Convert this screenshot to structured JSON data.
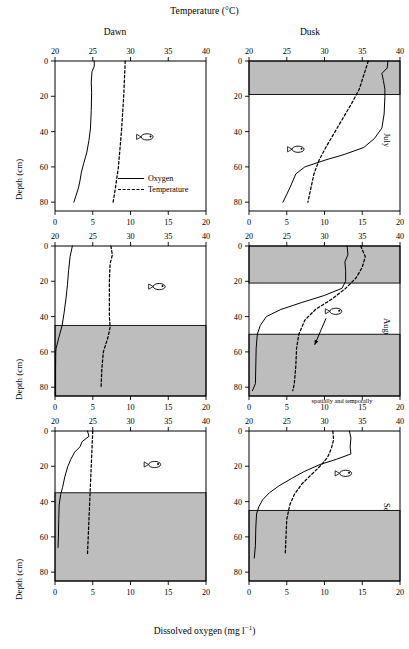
{
  "figure": {
    "top_axis_title": "Temperature (°C)",
    "bottom_axis_title": "Dissolved oxygen (mg l",
    "bottom_axis_title_sup": "−1",
    "bottom_axis_title_tail": ")",
    "depth_axis_title": "Depth (cm)",
    "column_titles": [
      "Dawn",
      "Dusk"
    ],
    "row_titles": [
      "July",
      "August",
      "September"
    ],
    "legend": {
      "oxygen_label": "Oxygen",
      "temperature_label": "Temperature"
    },
    "annotation": {
      "text": "The unshaded area available to fish compresses and expands spatially and temporally",
      "lines": [
        "The unshaded area",
        "available to fish",
        "compresses and expands",
        "spatially and temporally"
      ]
    },
    "colors": {
      "shaded_band": "#bdbdbd",
      "axis": "#000000",
      "oxygen_line": "#000000",
      "temperature_line": "#000000"
    },
    "icon_names": [
      "fish-icon",
      "annotation-arrow-icon"
    ]
  },
  "chart_data": {
    "type": "line",
    "xlabel": "Dissolved oxygen (mg l-1)",
    "ylabel": "Depth (cm)",
    "top_xlabel": "Temperature (°C)",
    "ylim": [
      0,
      85
    ],
    "y_inverted": true,
    "oxygen_xlim": [
      0,
      20
    ],
    "oxygen_ticks": [
      0,
      5,
      10,
      15,
      20
    ],
    "temperature_xlim": [
      20,
      40
    ],
    "temperature_ticks": [
      20,
      25,
      30,
      35,
      40
    ],
    "depth_ticks": [
      0,
      20,
      40,
      60,
      80
    ],
    "grid": false,
    "legend_position": "inside-lower-center-left-panel",
    "panels": [
      {
        "row": "July",
        "column": "Dawn",
        "shaded_bands": [],
        "fish_marker": {
          "oxygen": 12.2,
          "depth": 43
        },
        "series": [
          {
            "name": "Oxygen",
            "style": "solid",
            "axis": "bottom",
            "units": "mg l-1",
            "points": [
              {
                "depth": 0,
                "value": 5.2
              },
              {
                "depth": 3,
                "value": 5.2
              },
              {
                "depth": 6,
                "value": 4.9
              },
              {
                "depth": 12,
                "value": 4.8
              },
              {
                "depth": 18,
                "value": 4.85
              },
              {
                "depth": 28,
                "value": 4.8
              },
              {
                "depth": 38,
                "value": 4.7
              },
              {
                "depth": 45,
                "value": 4.5
              },
              {
                "depth": 52,
                "value": 4.2
              },
              {
                "depth": 58,
                "value": 3.8
              },
              {
                "depth": 63,
                "value": 3.5
              },
              {
                "depth": 68,
                "value": 3.3
              },
              {
                "depth": 72,
                "value": 3.1
              },
              {
                "depth": 76,
                "value": 2.8
              },
              {
                "depth": 80,
                "value": 2.5
              }
            ]
          },
          {
            "name": "Temperature",
            "style": "dashed",
            "axis": "top",
            "units": "°C",
            "points": [
              {
                "depth": 0,
                "value": 29.3
              },
              {
                "depth": 20,
                "value": 29.1
              },
              {
                "depth": 40,
                "value": 28.8
              },
              {
                "depth": 60,
                "value": 28.4
              },
              {
                "depth": 72,
                "value": 28.0
              },
              {
                "depth": 80,
                "value": 27.7
              }
            ]
          }
        ]
      },
      {
        "row": "July",
        "column": "Dusk",
        "shaded_bands": [
          {
            "top": 0,
            "bottom": 19
          }
        ],
        "fish_marker": {
          "oxygen": 6.5,
          "depth": 50
        },
        "series": [
          {
            "name": "Oxygen",
            "style": "solid",
            "axis": "bottom",
            "units": "mg l-1",
            "points": [
              {
                "depth": 0,
                "value": 18.4
              },
              {
                "depth": 4,
                "value": 18.3
              },
              {
                "depth": 7,
                "value": 17.6
              },
              {
                "depth": 11,
                "value": 17.8
              },
              {
                "depth": 16,
                "value": 18.0
              },
              {
                "depth": 20,
                "value": 18.0
              },
              {
                "depth": 30,
                "value": 17.9
              },
              {
                "depth": 38,
                "value": 17.6
              },
              {
                "depth": 44,
                "value": 16.6
              },
              {
                "depth": 49,
                "value": 15.2
              },
              {
                "depth": 53,
                "value": 12.6
              },
              {
                "depth": 56,
                "value": 10.2
              },
              {
                "depth": 60,
                "value": 7.4
              },
              {
                "depth": 64,
                "value": 6.2
              },
              {
                "depth": 72,
                "value": 5.4
              },
              {
                "depth": 80,
                "value": 4.5
              }
            ]
          },
          {
            "name": "Temperature",
            "style": "dashed",
            "axis": "top",
            "units": "°C",
            "points": [
              {
                "depth": 0,
                "value": 35.8
              },
              {
                "depth": 8,
                "value": 35.2
              },
              {
                "depth": 16,
                "value": 34.6
              },
              {
                "depth": 24,
                "value": 33.6
              },
              {
                "depth": 32,
                "value": 32.5
              },
              {
                "depth": 40,
                "value": 31.4
              },
              {
                "depth": 48,
                "value": 30.3
              },
              {
                "depth": 56,
                "value": 29.3
              },
              {
                "depth": 64,
                "value": 28.6
              },
              {
                "depth": 72,
                "value": 28.2
              },
              {
                "depth": 80,
                "value": 27.8
              }
            ]
          }
        ]
      },
      {
        "row": "August",
        "column": "Dawn",
        "shaded_bands": [
          {
            "top": 45,
            "bottom": 85
          }
        ],
        "fish_marker": {
          "oxygen": 13.8,
          "depth": 23
        },
        "series": [
          {
            "name": "Oxygen",
            "style": "solid",
            "axis": "bottom",
            "units": "mg l-1",
            "points": [
              {
                "depth": 0,
                "value": 2.3
              },
              {
                "depth": 6,
                "value": 2.0
              },
              {
                "depth": 14,
                "value": 1.8
              },
              {
                "depth": 22,
                "value": 1.65
              },
              {
                "depth": 30,
                "value": 1.45
              },
              {
                "depth": 38,
                "value": 1.2
              },
              {
                "depth": 45,
                "value": 0.95
              },
              {
                "depth": 52,
                "value": 0.5
              },
              {
                "depth": 58,
                "value": 0.15
              },
              {
                "depth": 60,
                "value": 0.1
              },
              {
                "depth": 70,
                "value": 0.08
              },
              {
                "depth": 80,
                "value": 0.08
              },
              {
                "depth": 85,
                "value": 0.08
              }
            ]
          },
          {
            "name": "Temperature",
            "style": "dashed",
            "axis": "top",
            "units": "°C",
            "points": [
              {
                "depth": 0,
                "value": 27.4
              },
              {
                "depth": 5,
                "value": 27.6
              },
              {
                "depth": 10,
                "value": 27.3
              },
              {
                "depth": 20,
                "value": 27.2
              },
              {
                "depth": 30,
                "value": 27.2
              },
              {
                "depth": 40,
                "value": 27.2
              },
              {
                "depth": 46,
                "value": 27.3
              },
              {
                "depth": 52,
                "value": 27.0
              },
              {
                "depth": 60,
                "value": 26.4
              },
              {
                "depth": 70,
                "value": 26.2
              },
              {
                "depth": 80,
                "value": 26.1
              }
            ]
          }
        ]
      },
      {
        "row": "August",
        "column": "Dusk",
        "shaded_bands": [
          {
            "top": 0,
            "bottom": 21
          },
          {
            "top": 50,
            "bottom": 85
          }
        ],
        "fish_marker": {
          "oxygen": 11.5,
          "depth": 37
        },
        "annotation_arrow": {
          "from_oxygen": 10.2,
          "from_depth": 41,
          "to_oxygen": 8.7,
          "to_depth": 56
        },
        "series": [
          {
            "name": "Oxygen",
            "style": "solid",
            "axis": "bottom",
            "units": "mg l-1",
            "points": [
              {
                "depth": 0,
                "value": 13.0
              },
              {
                "depth": 5,
                "value": 13.1
              },
              {
                "depth": 9,
                "value": 12.7
              },
              {
                "depth": 14,
                "value": 12.8
              },
              {
                "depth": 20,
                "value": 12.8
              },
              {
                "depth": 24,
                "value": 12.3
              },
              {
                "depth": 28,
                "value": 10.0
              },
              {
                "depth": 32,
                "value": 7.0
              },
              {
                "depth": 36,
                "value": 4.2
              },
              {
                "depth": 40,
                "value": 2.3
              },
              {
                "depth": 45,
                "value": 1.5
              },
              {
                "depth": 50,
                "value": 1.1
              },
              {
                "depth": 58,
                "value": 0.95
              },
              {
                "depth": 68,
                "value": 0.9
              },
              {
                "depth": 78,
                "value": 0.85
              },
              {
                "depth": 82,
                "value": 0.45
              }
            ]
          },
          {
            "name": "Temperature",
            "style": "dashed",
            "axis": "top",
            "units": "°C",
            "points": [
              {
                "depth": 0,
                "value": 34.8
              },
              {
                "depth": 6,
                "value": 35.4
              },
              {
                "depth": 12,
                "value": 35.0
              },
              {
                "depth": 18,
                "value": 34.2
              },
              {
                "depth": 24,
                "value": 32.8
              },
              {
                "depth": 30,
                "value": 31.0
              },
              {
                "depth": 36,
                "value": 28.8
              },
              {
                "depth": 42,
                "value": 27.4
              },
              {
                "depth": 50,
                "value": 26.6
              },
              {
                "depth": 58,
                "value": 26.3
              },
              {
                "depth": 68,
                "value": 26.2
              },
              {
                "depth": 78,
                "value": 26.0
              },
              {
                "depth": 82,
                "value": 25.8
              }
            ]
          }
        ]
      },
      {
        "row": "September",
        "column": "Dawn",
        "shaded_bands": [
          {
            "top": 35,
            "bottom": 85
          }
        ],
        "fish_marker": {
          "oxygen": 13.2,
          "depth": 19
        },
        "series": [
          {
            "name": "Oxygen",
            "style": "solid",
            "axis": "bottom",
            "units": "mg l-1",
            "points": [
              {
                "depth": 0,
                "value": 4.3
              },
              {
                "depth": 3,
                "value": 4.5
              },
              {
                "depth": 6,
                "value": 3.6
              },
              {
                "depth": 9,
                "value": 3.3
              },
              {
                "depth": 12,
                "value": 2.6
              },
              {
                "depth": 16,
                "value": 2.1
              },
              {
                "depth": 20,
                "value": 1.7
              },
              {
                "depth": 26,
                "value": 1.3
              },
              {
                "depth": 32,
                "value": 1.0
              },
              {
                "depth": 36,
                "value": 0.75
              },
              {
                "depth": 42,
                "value": 0.55
              },
              {
                "depth": 50,
                "value": 0.5
              },
              {
                "depth": 60,
                "value": 0.45
              },
              {
                "depth": 66,
                "value": 0.4
              }
            ]
          },
          {
            "name": "Temperature",
            "style": "dashed",
            "axis": "top",
            "units": "°C",
            "points": [
              {
                "depth": 0,
                "value": 25.0
              },
              {
                "depth": 10,
                "value": 24.9
              },
              {
                "depth": 20,
                "value": 24.8
              },
              {
                "depth": 30,
                "value": 24.7
              },
              {
                "depth": 40,
                "value": 24.6
              },
              {
                "depth": 50,
                "value": 24.5
              },
              {
                "depth": 60,
                "value": 24.4
              },
              {
                "depth": 70,
                "value": 24.3
              }
            ]
          }
        ]
      },
      {
        "row": "September",
        "column": "Dusk",
        "shaded_bands": [
          {
            "top": 45,
            "bottom": 85
          }
        ],
        "fish_marker": {
          "oxygen": 12.8,
          "depth": 24
        },
        "series": [
          {
            "name": "Oxygen",
            "style": "solid",
            "axis": "bottom",
            "units": "mg l-1",
            "points": [
              {
                "depth": 0,
                "value": 13.3
              },
              {
                "depth": 4,
                "value": 13.5
              },
              {
                "depth": 9,
                "value": 13.4
              },
              {
                "depth": 13,
                "value": 13.5
              },
              {
                "depth": 16,
                "value": 11.6
              },
              {
                "depth": 19,
                "value": 9.4
              },
              {
                "depth": 23,
                "value": 7.3
              },
              {
                "depth": 27,
                "value": 5.6
              },
              {
                "depth": 31,
                "value": 4.0
              },
              {
                "depth": 35,
                "value": 2.7
              },
              {
                "depth": 39,
                "value": 1.8
              },
              {
                "depth": 43,
                "value": 1.3
              },
              {
                "depth": 47,
                "value": 1.0
              },
              {
                "depth": 55,
                "value": 0.9
              },
              {
                "depth": 65,
                "value": 0.85
              },
              {
                "depth": 72,
                "value": 0.7
              }
            ]
          },
          {
            "name": "Temperature",
            "style": "dashed",
            "axis": "top",
            "units": "°C",
            "points": [
              {
                "depth": 0,
                "value": 31.1
              },
              {
                "depth": 5,
                "value": 31.2
              },
              {
                "depth": 10,
                "value": 30.9
              },
              {
                "depth": 15,
                "value": 30.4
              },
              {
                "depth": 20,
                "value": 29.4
              },
              {
                "depth": 25,
                "value": 28.2
              },
              {
                "depth": 30,
                "value": 27.0
              },
              {
                "depth": 36,
                "value": 26.0
              },
              {
                "depth": 42,
                "value": 25.4
              },
              {
                "depth": 50,
                "value": 25.0
              },
              {
                "depth": 60,
                "value": 24.9
              },
              {
                "depth": 70,
                "value": 24.8
              }
            ]
          }
        ]
      }
    ]
  }
}
